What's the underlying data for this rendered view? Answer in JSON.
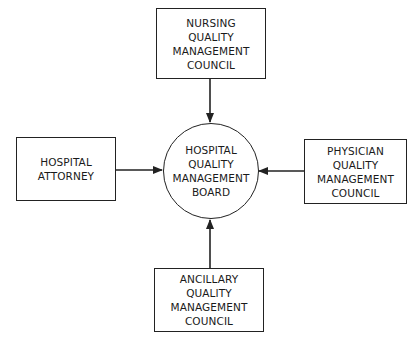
{
  "diagram": {
    "center": {
      "lines": [
        "HOSPITAL",
        "QUALITY",
        "MANAGEMENT",
        "BOARD"
      ]
    },
    "nodes": {
      "top": {
        "lines": [
          "NURSING",
          "QUALITY",
          "MANAGEMENT",
          "COUNCIL"
        ]
      },
      "left": {
        "lines": [
          "HOSPITAL",
          "ATTORNEY"
        ]
      },
      "right": {
        "lines": [
          "PHYSICIAN",
          "QUALITY",
          "MANAGEMENT",
          "COUNCIL"
        ]
      },
      "bottom": {
        "lines": [
          "ANCILLARY",
          "QUALITY",
          "MANAGEMENT",
          "COUNCIL"
        ]
      }
    },
    "edges": [
      {
        "from": "top",
        "to": "center"
      },
      {
        "from": "left",
        "to": "center"
      },
      {
        "from": "right",
        "to": "center"
      },
      {
        "from": "bottom",
        "to": "center"
      }
    ],
    "colors": {
      "stroke": "#222222",
      "background": "#ffffff"
    }
  }
}
